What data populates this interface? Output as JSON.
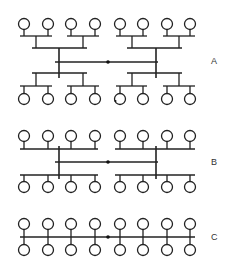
{
  "diagrams": [
    {
      "id": "A",
      "label": "A",
      "label_pos": [
        211,
        56
      ],
      "topology": "two-level tree"
    },
    {
      "id": "B",
      "label": "B",
      "label_pos": [
        211,
        157
      ],
      "topology": "single-level tree"
    },
    {
      "id": "C",
      "label": "C",
      "label_pos": [
        211,
        232
      ],
      "topology": "linear bus"
    }
  ],
  "style": {
    "stroke": "#222222",
    "fill": "#ffffff"
  },
  "node_x": [
    24,
    48,
    71,
    95,
    120,
    143,
    167,
    190
  ]
}
